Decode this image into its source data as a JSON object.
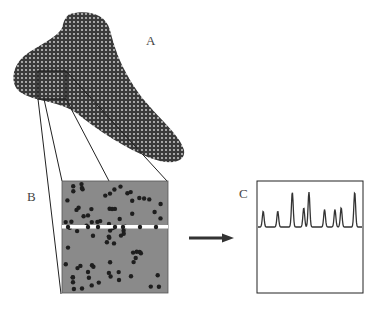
{
  "diagram": {
    "labels": {
      "a": "A",
      "b": "B",
      "c": "C"
    },
    "panel_a": {
      "description": "Tissue section with hatched texture and square region of interest"
    },
    "panel_b": {
      "description": "Magnified region with scattered dots and a horizontal scan line",
      "dot_count": 80
    },
    "panel_c": {
      "description": "Intensity profile along scan line showing peaks",
      "peaks": [
        {
          "position": 0.05,
          "height": 0.45
        },
        {
          "position": 0.19,
          "height": 0.45
        },
        {
          "position": 0.33,
          "height": 1.0
        },
        {
          "position": 0.44,
          "height": 0.55
        },
        {
          "position": 0.49,
          "height": 1.0
        },
        {
          "position": 0.64,
          "height": 0.5
        },
        {
          "position": 0.74,
          "height": 0.5
        },
        {
          "position": 0.8,
          "height": 0.55
        },
        {
          "position": 0.93,
          "height": 1.0
        }
      ]
    },
    "colors": {
      "outline": "#222222",
      "fill_b": "#8a8a8a",
      "dot": "#1e1e1e",
      "hatch_dark": "#3a3a3a",
      "hatch_light": "#d8d8d8"
    }
  }
}
